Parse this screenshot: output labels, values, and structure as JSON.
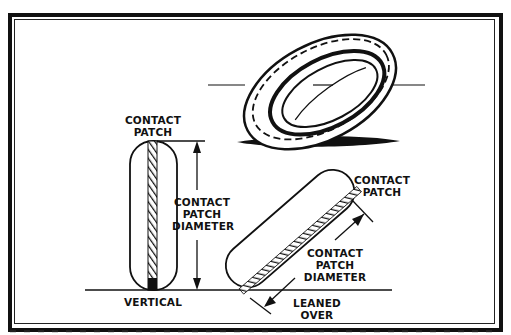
{
  "figure": {
    "colors": {
      "ink": "#111111",
      "background": "#ffffff"
    }
  },
  "labels": {
    "vertical_contact_patch": "CONTACT\nPATCH",
    "vertical_diameter": "CONTACT\nPATCH\nDIAMETER",
    "vertical": "VERTICAL",
    "leaned_contact_patch": "CONTACT\nPATCH",
    "leaned_diameter": "CONTACT\nPATCH\nDIAMETER",
    "leaned_over": "LEANED\nOVER"
  },
  "icons": {
    "tire_perspective": "tire-perspective-icon",
    "tire_vertical_section": "tire-vertical-section-icon",
    "tire_leaned_section": "tire-leaned-section-icon"
  }
}
